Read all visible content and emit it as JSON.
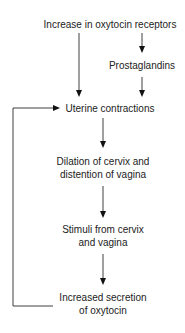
{
  "diagram": {
    "nodes": [
      {
        "id": "receptors",
        "lines": [
          "Increase in oxytocin receptors"
        ]
      },
      {
        "id": "prostaglandins",
        "lines": [
          "Prostaglandins"
        ]
      },
      {
        "id": "contractions",
        "lines": [
          "Uterine contractions"
        ]
      },
      {
        "id": "dilation",
        "lines": [
          "Dilation of cervix and",
          "distention of vagina"
        ]
      },
      {
        "id": "stimuli",
        "lines": [
          "Stimuli from cervix",
          "and vagina"
        ]
      },
      {
        "id": "secretion",
        "lines": [
          "Increased secretion",
          "of oxytocin"
        ]
      }
    ],
    "edges": [
      {
        "from": "receptors",
        "to": "contractions"
      },
      {
        "from": "receptors",
        "to": "prostaglandins"
      },
      {
        "from": "prostaglandins",
        "to": "contractions"
      },
      {
        "from": "contractions",
        "to": "dilation"
      },
      {
        "from": "dilation",
        "to": "stimuli"
      },
      {
        "from": "stimuli",
        "to": "secretion"
      },
      {
        "from": "secretion",
        "to": "contractions",
        "type": "feedback"
      }
    ],
    "colors": {
      "line": "#2a2a2a",
      "text": "#222222",
      "background": "#ffffff"
    }
  }
}
